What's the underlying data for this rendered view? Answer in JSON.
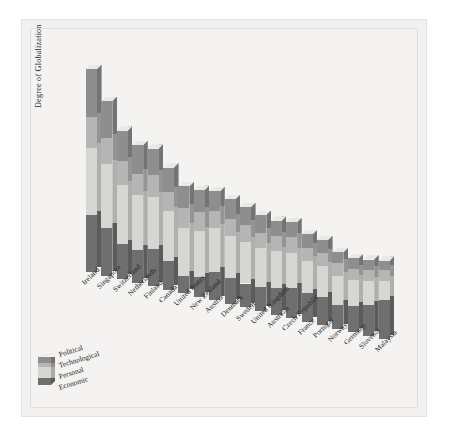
{
  "chart_data": {
    "type": "bar",
    "subtype": "stacked-bar-3d",
    "title": "",
    "xlabel": "",
    "ylabel": "Degree of Globalization",
    "grid": false,
    "legend_position": "bottom-left",
    "axis_values_shown": false,
    "categories": [
      "Ireland",
      "Singapore",
      "Switzerland",
      "Netherlands",
      "Finland",
      "Canada",
      "United States",
      "New Zealand",
      "Austria",
      "Denmark",
      "Sweden",
      "United Kingdom",
      "Australia",
      "Czech Republic",
      "France",
      "Portugal",
      "Norway",
      "Germany",
      "Slovenia",
      "Malaysia"
    ],
    "series": [
      {
        "name": "Political",
        "color": "#8e8e8e",
        "values": [
          22,
          17,
          14,
          13,
          12,
          11,
          10,
          10,
          9,
          9,
          8,
          8,
          7,
          7,
          6,
          6,
          5,
          5,
          5,
          4
        ]
      },
      {
        "name": "Technological",
        "color": "#b5b5b5",
        "values": [
          14,
          12,
          11,
          10,
          10,
          9,
          9,
          9,
          8,
          8,
          8,
          7,
          7,
          7,
          6,
          6,
          6,
          5,
          5,
          5
        ]
      },
      {
        "name": "Personal",
        "color": "#d6d6d2",
        "values": [
          31,
          29,
          27,
          25,
          24,
          23,
          22,
          21,
          20,
          19,
          19,
          18,
          17,
          16,
          15,
          14,
          13,
          12,
          11,
          9
        ]
      },
      {
        "name": "Economic",
        "color": "#6f6f6f",
        "values": [
          26,
          22,
          16,
          15,
          17,
          13,
          8,
          9,
          13,
          12,
          11,
          11,
          12,
          14,
          13,
          13,
          11,
          12,
          14,
          18
        ]
      }
    ],
    "totals": [
      93,
      80,
      68,
      63,
      63,
      56,
      49,
      49,
      50,
      48,
      46,
      44,
      43,
      44,
      40,
      39,
      35,
      34,
      35,
      36
    ],
    "legend_entries": [
      "Political",
      "Technological",
      "Personal",
      "Economic"
    ],
    "stack_order_top_to_bottom": [
      "Political",
      "Technological",
      "Personal",
      "Economic"
    ]
  },
  "colors": {
    "page_background": "#ffffff",
    "panel_background": "#f2f1ef",
    "plot_background": "#f4f3f1",
    "political": "#8e8e8e",
    "technological": "#b5b5b5",
    "personal": "#d6d6d2",
    "economic": "#6f6f6f",
    "side_shade": "#a8a8a4",
    "top_shade": "#e9e8e4",
    "text": "#232323"
  }
}
